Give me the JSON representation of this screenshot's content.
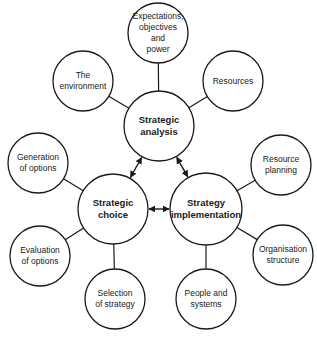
{
  "diagram": {
    "colors": {
      "stroke": "#1a1a1a",
      "fill": "#ffffff",
      "text": "#1a1a1a"
    },
    "main_nodes": [
      {
        "id": "analysis",
        "label": "Strategic\nanalysis",
        "cx": 159,
        "cy": 126,
        "r": 35
      },
      {
        "id": "choice",
        "label": "Strategic\nchoice",
        "cx": 113,
        "cy": 209,
        "r": 35
      },
      {
        "id": "implementation",
        "label": "Strategy\nimplementation",
        "cx": 206,
        "cy": 209,
        "r": 36
      }
    ],
    "satellite_nodes": [
      {
        "id": "expectations",
        "parent": "analysis",
        "label": "Expectations,\nobjectives\nand\npower",
        "cx": 158,
        "cy": 33,
        "r": 30
      },
      {
        "id": "environment",
        "parent": "analysis",
        "label": "The\nenvironment",
        "cx": 83,
        "cy": 81,
        "r": 30
      },
      {
        "id": "resources",
        "parent": "analysis",
        "label": "Resources",
        "cx": 233,
        "cy": 81,
        "r": 30
      },
      {
        "id": "generation",
        "parent": "choice",
        "label": "Generation\nof options",
        "cx": 38,
        "cy": 163,
        "r": 30
      },
      {
        "id": "evaluation",
        "parent": "choice",
        "label": "Evaluation\nof options",
        "cx": 40,
        "cy": 256,
        "r": 30
      },
      {
        "id": "selection",
        "parent": "choice",
        "label": "Selection\nof strategy",
        "cx": 115,
        "cy": 299,
        "r": 30
      },
      {
        "id": "resource-planning",
        "parent": "implementation",
        "label": "Resource\nplanning",
        "cx": 281,
        "cy": 165,
        "r": 30
      },
      {
        "id": "organisation",
        "parent": "implementation",
        "label": "Organisation\nstructure",
        "cx": 283,
        "cy": 255,
        "r": 30
      },
      {
        "id": "people",
        "parent": "implementation",
        "label": "People and\nsystems",
        "cx": 206,
        "cy": 299,
        "r": 30
      }
    ],
    "arrows": [
      {
        "from": "analysis",
        "to": "choice",
        "type": "bidirectional"
      },
      {
        "from": "analysis",
        "to": "implementation",
        "type": "bidirectional"
      },
      {
        "from": "choice",
        "to": "implementation",
        "type": "bidirectional"
      }
    ]
  }
}
